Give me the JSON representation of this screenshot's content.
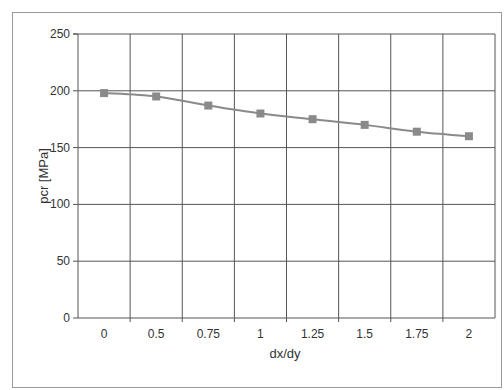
{
  "chart_data": {
    "type": "line",
    "title": "",
    "xlabel": "dx/dy",
    "ylabel": "pcr [MPa]",
    "categories": [
      "0",
      "0.5",
      "0.75",
      "1",
      "1.25",
      "1.5",
      "1.75",
      "2"
    ],
    "series": [
      {
        "name": "pcr",
        "values": [
          198,
          195,
          187,
          180,
          175,
          170,
          164,
          160
        ],
        "color": "#8a8a8a",
        "marker": "square"
      }
    ],
    "ylim": [
      0,
      250
    ],
    "yticks": [
      0,
      50,
      100,
      150,
      200,
      250
    ],
    "grid": true,
    "legend": "none"
  }
}
